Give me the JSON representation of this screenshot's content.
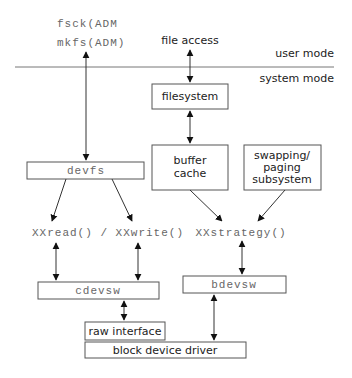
{
  "diagram": {
    "mode_labels": {
      "user": "user mode",
      "system": "system mode"
    },
    "admin_commands": {
      "fsck": "fsck(ADM",
      "mkfs": "mkfs(ADM)"
    },
    "file_access": "file access",
    "boxes": {
      "filesystem": "filesystem",
      "buffer_cache_line1": "buffer",
      "buffer_cache_line2": "cache",
      "swapping_line1": "swapping/",
      "swapping_line2": "paging",
      "swapping_line3": "subsystem",
      "devfs": "devfs",
      "cdevsw": "cdevsw",
      "bdevsw": "bdevsw",
      "raw_interface": "raw interface",
      "block_device_driver": "block device driver"
    },
    "functions": {
      "read_write": "XXread() / XXwrite()",
      "strategy": "XXstrategy()"
    }
  }
}
